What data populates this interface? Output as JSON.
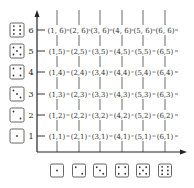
{
  "diagram": {
    "x_axis": {
      "dice_faces": [
        1,
        2,
        3,
        4,
        5,
        6
      ]
    },
    "y_axis": {
      "labels": [
        "1",
        "2",
        "3",
        "4",
        "5",
        "6"
      ],
      "dice_faces": [
        1,
        2,
        3,
        4,
        5,
        6
      ]
    },
    "rows": [
      {
        "y_value": 6,
        "cells": [
          "(1, 6)",
          "(2, 6)",
          "(3, 6)",
          "(4, 6)",
          "(5, 6)",
          "(6, 6)"
        ]
      },
      {
        "y_value": 5,
        "cells": [
          "(1,5)",
          "(2,5)",
          "(3,5)",
          "(4,5)",
          "(5,5)",
          "(6,5)"
        ]
      },
      {
        "y_value": 4,
        "cells": [
          "(1,4)",
          "(2,4)",
          "(3,4)",
          "(4,4)",
          "(5,4)",
          "(6,4)"
        ]
      },
      {
        "y_value": 3,
        "cells": [
          "(1,3)",
          "(2,3)",
          "(3,3)",
          "(4,3)",
          "(5,3)",
          "(6,3)"
        ]
      },
      {
        "y_value": 2,
        "cells": [
          "(1,2)",
          "(2,2)",
          "(3,2)",
          "(4,2)",
          "(5,2)",
          "(6,2)"
        ]
      },
      {
        "y_value": 1,
        "cells": [
          "(1,1)",
          "(2,1)",
          "(3,1)",
          "(4,1)",
          "(5,1)",
          "(6,1)"
        ]
      }
    ],
    "colors": {
      "line": "#222222",
      "text": "#333333",
      "die_border": "#555555"
    }
  }
}
